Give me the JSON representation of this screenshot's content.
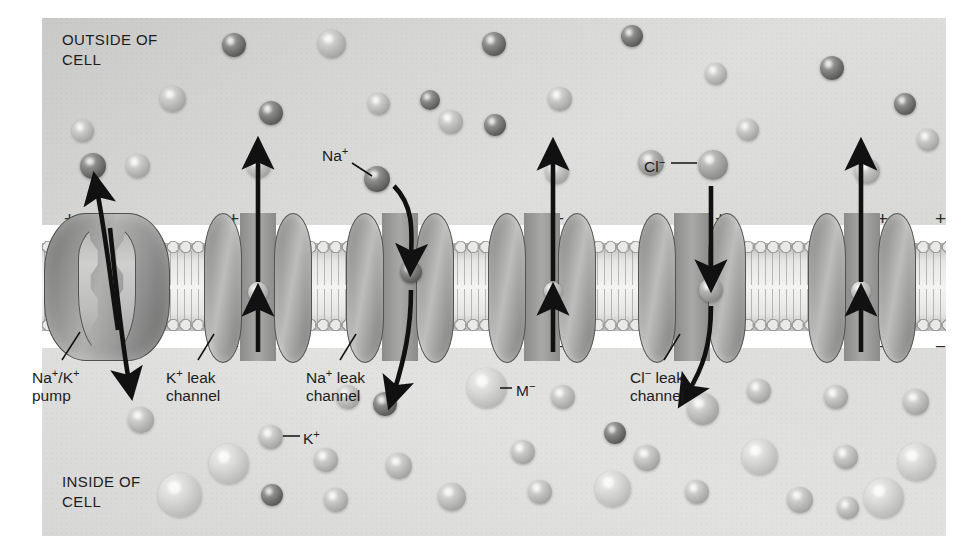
{
  "figure": {
    "regions": {
      "outside_label": "OUTSIDE OF\nCELL",
      "inside_label": "INSIDE OF\nCELL"
    },
    "membrane": {
      "outer_charge": "+",
      "inner_charge": "−",
      "charge_count": 7,
      "charge_x": [
        22,
        186,
        348,
        511,
        673,
        835,
        893
      ]
    },
    "proteins": [
      {
        "id": "na-k-pump",
        "name": "Na⁺/K⁺ pump",
        "label": "Na⁺/K⁺\npump",
        "type": "pump",
        "x": 44,
        "label_x": 32,
        "label_y": 367
      },
      {
        "id": "k-leak-channel-1",
        "name": "K⁺ leak channel",
        "label": "K⁺ leak\nchannel",
        "type": "channel",
        "x": 204,
        "label_x": 166,
        "label_y": 367
      },
      {
        "id": "na-leak-channel",
        "name": "Na⁺ leak channel",
        "label": "Na⁺ leak\nchannel",
        "type": "channel",
        "x": 346,
        "label_x": 306,
        "label_y": 367
      },
      {
        "id": "k-leak-channel-2",
        "name": "K⁺ leak channel",
        "label": "",
        "type": "channel",
        "x": 488,
        "label_x": 0,
        "label_y": 0
      },
      {
        "id": "cl-leak-channel",
        "name": "Cl⁻ leak channel",
        "label": "Cl⁻ leak\nchannel",
        "type": "channel",
        "x": 638,
        "label_x": 630,
        "label_y": 367
      },
      {
        "id": "k-leak-channel-3",
        "name": "K⁺ leak channel",
        "label": "",
        "type": "channel",
        "x": 808,
        "label_x": 0,
        "label_y": 0
      }
    ],
    "callouts": [
      {
        "id": "na-callout",
        "label": "Na⁺",
        "x": 322,
        "y": 146,
        "ion": "na"
      },
      {
        "id": "cl-callout",
        "label": "Cl⁻",
        "x": 644,
        "y": 157,
        "ion": "cl"
      },
      {
        "id": "k-callout",
        "label": "K⁺",
        "x": 303,
        "y": 429,
        "ion": "k"
      },
      {
        "id": "m-callout",
        "label": "M⁻",
        "x": 516,
        "y": 381,
        "ion": "m"
      }
    ],
    "ion_species": [
      {
        "id": "na",
        "label": "Na⁺",
        "tone": "dark",
        "color": "#5e5e5c",
        "radius": 11
      },
      {
        "id": "cl",
        "label": "Cl⁻",
        "tone": "medium",
        "color": "#9b9b99",
        "radius": 13
      },
      {
        "id": "k",
        "label": "K⁺",
        "tone": "light",
        "color": "#c2c2c0",
        "radius": 12
      },
      {
        "id": "m",
        "label": "M⁻",
        "tone": "very-light",
        "color": "#dadad8",
        "radius": 19
      }
    ],
    "outside_ions": [
      {
        "t": "na",
        "x": 234,
        "y": 45,
        "r": 12
      },
      {
        "t": "k",
        "x": 332,
        "y": 44,
        "r": 14
      },
      {
        "t": "na",
        "x": 494,
        "y": 44,
        "r": 12
      },
      {
        "t": "na",
        "x": 632,
        "y": 36,
        "r": 11
      },
      {
        "t": "k",
        "x": 716,
        "y": 74,
        "r": 11
      },
      {
        "t": "na",
        "x": 832,
        "y": 68,
        "r": 12
      },
      {
        "t": "k",
        "x": 173,
        "y": 99,
        "r": 13
      },
      {
        "t": "na",
        "x": 271,
        "y": 113,
        "r": 12
      },
      {
        "t": "k",
        "x": 379,
        "y": 104,
        "r": 11
      },
      {
        "t": "na",
        "x": 430,
        "y": 100,
        "r": 10
      },
      {
        "t": "k",
        "x": 451,
        "y": 122,
        "r": 12
      },
      {
        "t": "na",
        "x": 495,
        "y": 125,
        "r": 11
      },
      {
        "t": "k",
        "x": 560,
        "y": 99,
        "r": 12
      },
      {
        "t": "na",
        "x": 905,
        "y": 104,
        "r": 11
      },
      {
        "t": "k",
        "x": 83,
        "y": 131,
        "r": 11
      },
      {
        "t": "na",
        "x": 93,
        "y": 166,
        "r": 13
      },
      {
        "t": "k",
        "x": 138,
        "y": 166,
        "r": 12
      },
      {
        "t": "na",
        "x": 377,
        "y": 179,
        "r": 13
      },
      {
        "t": "k",
        "x": 259,
        "y": 166,
        "r": 12
      },
      {
        "t": "k",
        "x": 557,
        "y": 172,
        "r": 12
      },
      {
        "t": "cl",
        "x": 651,
        "y": 163,
        "r": 13
      },
      {
        "t": "cl",
        "x": 713,
        "y": 165,
        "r": 15
      },
      {
        "t": "k",
        "x": 748,
        "y": 130,
        "r": 11
      },
      {
        "t": "k",
        "x": 867,
        "y": 171,
        "r": 13
      },
      {
        "t": "k",
        "x": 928,
        "y": 140,
        "r": 11
      }
    ],
    "inside_ions": [
      {
        "t": "k",
        "x": 141,
        "y": 420,
        "r": 13
      },
      {
        "t": "k",
        "x": 271,
        "y": 437,
        "r": 12
      },
      {
        "t": "k",
        "x": 348,
        "y": 397,
        "r": 12
      },
      {
        "t": "na",
        "x": 385,
        "y": 404,
        "r": 12
      },
      {
        "t": "m",
        "x": 487,
        "y": 388,
        "r": 20
      },
      {
        "t": "k",
        "x": 563,
        "y": 397,
        "r": 12
      },
      {
        "t": "na",
        "x": 615,
        "y": 433,
        "r": 11
      },
      {
        "t": "k",
        "x": 703,
        "y": 409,
        "r": 16
      },
      {
        "t": "k",
        "x": 759,
        "y": 391,
        "r": 12
      },
      {
        "t": "k",
        "x": 836,
        "y": 397,
        "r": 12
      },
      {
        "t": "k",
        "x": 916,
        "y": 402,
        "r": 13
      },
      {
        "t": "m",
        "x": 229,
        "y": 464,
        "r": 20
      },
      {
        "t": "k",
        "x": 326,
        "y": 460,
        "r": 12
      },
      {
        "t": "k",
        "x": 399,
        "y": 466,
        "r": 13
      },
      {
        "t": "k",
        "x": 523,
        "y": 452,
        "r": 12
      },
      {
        "t": "k",
        "x": 647,
        "y": 458,
        "r": 13
      },
      {
        "t": "m",
        "x": 760,
        "y": 457,
        "r": 18
      },
      {
        "t": "k",
        "x": 846,
        "y": 457,
        "r": 12
      },
      {
        "t": "m",
        "x": 917,
        "y": 462,
        "r": 19
      },
      {
        "t": "m",
        "x": 180,
        "y": 495,
        "r": 22
      },
      {
        "t": "na",
        "x": 272,
        "y": 495,
        "r": 11
      },
      {
        "t": "k",
        "x": 336,
        "y": 500,
        "r": 12
      },
      {
        "t": "k",
        "x": 452,
        "y": 497,
        "r": 14
      },
      {
        "t": "k",
        "x": 540,
        "y": 492,
        "r": 12
      },
      {
        "t": "m",
        "x": 613,
        "y": 489,
        "r": 18
      },
      {
        "t": "k",
        "x": 697,
        "y": 492,
        "r": 12
      },
      {
        "t": "k",
        "x": 800,
        "y": 500,
        "r": 13
      },
      {
        "t": "m",
        "x": 884,
        "y": 498,
        "r": 20
      },
      {
        "t": "k",
        "x": 848,
        "y": 508,
        "r": 11
      }
    ],
    "pore_ions": [
      {
        "protein": "k-leak-channel-1",
        "t": "k",
        "x": 258,
        "y": 292,
        "r": 10
      },
      {
        "protein": "na-leak-channel",
        "t": "na",
        "x": 411,
        "y": 272,
        "r": 11
      },
      {
        "protein": "k-leak-channel-2",
        "t": "k",
        "x": 553,
        "y": 291,
        "r": 9
      },
      {
        "protein": "cl-leak-channel",
        "t": "cl",
        "x": 711,
        "y": 290,
        "r": 12
      },
      {
        "protein": "k-leak-channel-3",
        "t": "k",
        "x": 861,
        "y": 291,
        "r": 10
      }
    ],
    "arrows": [
      {
        "id": "pump-na-out-arrow",
        "direction": "out",
        "kind": "curved"
      },
      {
        "id": "pump-k-in-arrow",
        "direction": "in",
        "kind": "curved"
      },
      {
        "id": "k-leak-1-arrow",
        "direction": "out",
        "kind": "straight"
      },
      {
        "id": "na-leak-in-arrow",
        "direction": "in",
        "kind": "curved"
      },
      {
        "id": "k-leak-2-arrow",
        "direction": "out",
        "kind": "straight"
      },
      {
        "id": "cl-leak-in-arrow",
        "direction": "in",
        "kind": "curved"
      },
      {
        "id": "k-leak-3-arrow",
        "direction": "out",
        "kind": "straight"
      }
    ]
  }
}
